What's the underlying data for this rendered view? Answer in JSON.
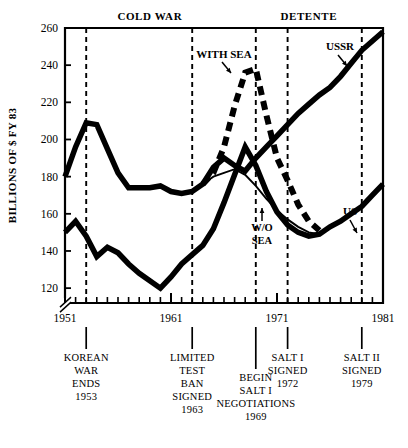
{
  "chart_data": {
    "type": "line",
    "title": "",
    "xlabel": "",
    "ylabel": "BILLIONS OF $ FY 83",
    "xlim": [
      1951,
      1981
    ],
    "ylim": [
      112,
      260
    ],
    "grid": false,
    "legend": "inline-annotations",
    "y_ticks": [
      120,
      140,
      160,
      180,
      200,
      220,
      240,
      260
    ],
    "y_tick_labels": [
      "120",
      "140",
      "160",
      "180",
      "200",
      "220",
      "240",
      "260"
    ],
    "x_ticks": [
      1951,
      1961,
      1971,
      1981
    ],
    "x_tick_labels": [
      "1951",
      "1961",
      "1971",
      "1981"
    ],
    "x_minor_tick_interval": 1,
    "axis_break": true,
    "series": [
      {
        "name": "USSR",
        "style": "thick-solid",
        "x": [
          1951,
          1952,
          1953,
          1954,
          1955,
          1956,
          1957,
          1958,
          1959,
          1960,
          1961,
          1962,
          1963,
          1964,
          1965,
          1966,
          1967,
          1968,
          1969,
          1970,
          1971,
          1972,
          1973,
          1974,
          1975,
          1976,
          1977,
          1978,
          1979,
          1980,
          1981
        ],
        "values": [
          180,
          196,
          209,
          208,
          195,
          182,
          174,
          174,
          174,
          175,
          172,
          171,
          172,
          176,
          185,
          190,
          186,
          183,
          190,
          196,
          202,
          208,
          214,
          219,
          224,
          228,
          234,
          241,
          248,
          253,
          258
        ]
      },
      {
        "name": "US",
        "style": "thick-solid",
        "x": [
          1951,
          1952,
          1953,
          1954,
          1955,
          1956,
          1957,
          1958,
          1959,
          1960,
          1961,
          1962,
          1963,
          1964,
          1965,
          1966,
          1967,
          1968,
          1969,
          1970,
          1971,
          1972,
          1973,
          1974,
          1975,
          1976,
          1977,
          1978,
          1979,
          1980,
          1981
        ],
        "values": [
          150,
          156,
          148,
          137,
          142,
          139,
          133,
          128,
          124,
          120,
          126,
          133,
          138,
          143,
          152,
          166,
          181,
          196,
          186,
          172,
          161,
          154,
          150,
          148,
          149,
          153,
          156,
          160,
          164,
          170,
          176
        ]
      },
      {
        "name": "WITH SEA",
        "style": "thick-dashed",
        "x": [
          1964,
          1965,
          1966,
          1967,
          1968,
          1969,
          1970,
          1971,
          1972,
          1973,
          1974,
          1975
        ],
        "values": [
          176,
          182,
          196,
          218,
          236,
          238,
          213,
          190,
          178,
          165,
          156,
          151
        ]
      },
      {
        "name": "W/O SEA",
        "style": "thin-solid",
        "x": [
          1964,
          1965,
          1966,
          1967,
          1968,
          1969,
          1970,
          1971,
          1972,
          1973,
          1974,
          1975
        ],
        "values": [
          176,
          180,
          182,
          184,
          181,
          175,
          168,
          162,
          157,
          153,
          150,
          149
        ]
      }
    ],
    "series_annotations": [
      {
        "label": "USSR",
        "note": "arrow pointing down-right to USSR curve"
      },
      {
        "label": "US",
        "note": "arrow pointing down-right to US curve"
      },
      {
        "label": "WITH SEA",
        "note": "arrow pointing down-right to dashed peak"
      },
      {
        "label": "W/O SEA",
        "note": "arrow pointing up to thin line"
      }
    ],
    "era_labels": [
      {
        "text": "COLD WAR",
        "x": 1959
      },
      {
        "text": "DETENTE",
        "x": 1974
      }
    ],
    "event_markers": [
      {
        "year": 1953,
        "lines": [
          "KOREAN",
          "WAR",
          "ENDS",
          "1953"
        ]
      },
      {
        "year": 1963,
        "lines": [
          "LIMITED",
          "TEST",
          "BAN",
          "SIGNED",
          "1963"
        ]
      },
      {
        "year": 1969,
        "lines": [
          "BEGIN",
          "SALT I",
          "NEGOTIATIONS",
          "1969"
        ]
      },
      {
        "year": 1972,
        "lines": [
          "SALT I",
          "SIGNED",
          "1972"
        ]
      },
      {
        "year": 1979,
        "lines": [
          "SALT II",
          "SIGNED",
          "1979"
        ]
      }
    ]
  }
}
